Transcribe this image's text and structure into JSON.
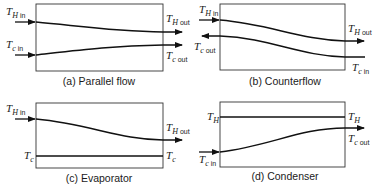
{
  "figure": {
    "panels": [
      {
        "id": "a",
        "caption": "(a) Parallel flow",
        "labels": {
          "hot_in": {
            "main": "T",
            "sub_i": "H",
            "sub": "in"
          },
          "hot_out": {
            "main": "T",
            "sub_i": "H",
            "sub": "out"
          },
          "cold_in": {
            "main": "T",
            "sub_i": "c",
            "sub": "in"
          },
          "cold_out": {
            "main": "T",
            "sub_i": "c",
            "sub": "out"
          }
        }
      },
      {
        "id": "b",
        "caption": "(b) Counterflow",
        "labels": {
          "hot_in": {
            "main": "T",
            "sub_i": "H",
            "sub": "in"
          },
          "hot_out": {
            "main": "T",
            "sub_i": "H",
            "sub": "out"
          },
          "cold_out": {
            "main": "T",
            "sub_i": "c",
            "sub": "out"
          },
          "cold_in": {
            "main": "T",
            "sub_i": "c",
            "sub": "in"
          }
        }
      },
      {
        "id": "c",
        "caption": "(c) Evaporator",
        "labels": {
          "hot_in": {
            "main": "T",
            "sub_i": "H",
            "sub": "in"
          },
          "hot_out": {
            "main": "T",
            "sub_i": "H",
            "sub": "out"
          },
          "cold_left": {
            "main": "T",
            "sub_i": "c"
          },
          "cold_right": {
            "main": "T",
            "sub_i": "c"
          }
        }
      },
      {
        "id": "d",
        "caption": "(d) Condenser",
        "labels": {
          "hot_left": {
            "main": "T",
            "sub_i": "H"
          },
          "hot_right": {
            "main": "T",
            "sub_i": "H"
          },
          "cold_out": {
            "main": "T",
            "sub_i": "c",
            "sub": "out"
          },
          "cold_in": {
            "main": "T",
            "sub_i": "c",
            "sub": "in"
          }
        }
      }
    ],
    "colors": {
      "line": "#111111",
      "box": "#333333",
      "background": "#ffffff"
    }
  }
}
